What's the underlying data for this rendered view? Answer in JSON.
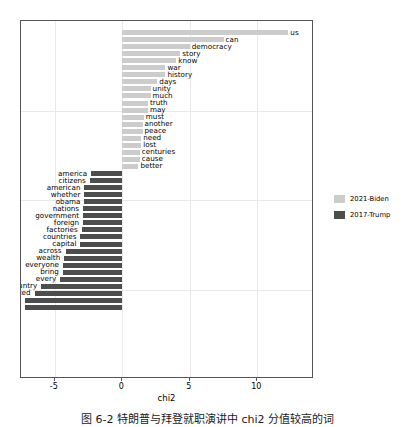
{
  "chart_data": {
    "type": "bar",
    "orientation": "horizontal",
    "title": "",
    "xlabel": "chi2",
    "ylabel": "",
    "xlim": [
      -7.5,
      14.2
    ],
    "xticks": [
      -5,
      0,
      5,
      10
    ],
    "xtick_labels": [
      "-5",
      "0",
      "5",
      "10"
    ],
    "grid": true,
    "legend_position": "right",
    "series": [
      {
        "name": "2021-Biden",
        "color": "#cccccc",
        "categories": [
          "us",
          "can",
          "democracy",
          "story",
          "know",
          "war",
          "history",
          "days",
          "unity",
          "much",
          "truth",
          "may",
          "must",
          "another",
          "peace",
          "need",
          "lost",
          "centuries",
          "cause",
          "better"
        ],
        "values": [
          12.3,
          7.5,
          5.0,
          4.3,
          4.0,
          3.2,
          3.2,
          2.6,
          2.1,
          2.1,
          1.9,
          1.9,
          1.6,
          1.5,
          1.5,
          1.4,
          1.4,
          1.3,
          1.3,
          1.2
        ]
      },
      {
        "name": "2017-Trump",
        "color": "#4d4d4d",
        "categories": [
          "america",
          "citizens",
          "american",
          "whether",
          "obama",
          "nations",
          "government",
          "foreign",
          "factories",
          "countries",
          "capital",
          "across",
          "wealth",
          "everyone",
          "bring",
          "every",
          "country",
          "protected",
          "dreams",
          "back"
        ],
        "values": [
          -2.3,
          -2.4,
          -2.8,
          -2.8,
          -2.8,
          -2.9,
          -2.9,
          -2.9,
          -3.0,
          -3.1,
          -3.1,
          -4.2,
          -4.3,
          -4.4,
          -4.4,
          -4.6,
          -6.0,
          -6.5,
          -7.2,
          -7.2
        ]
      }
    ]
  },
  "legend": {
    "items": [
      {
        "label": "2021-Biden",
        "color": "#cccccc"
      },
      {
        "label": "2017-Trump",
        "color": "#4d4d4d"
      }
    ]
  },
  "axis": {
    "x_title": "chi2"
  },
  "caption": {
    "text": "图 6-2  特朗普与拜登就职演讲中 chi2 分值较高的词"
  }
}
